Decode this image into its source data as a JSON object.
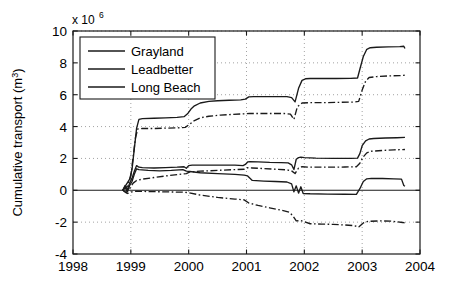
{
  "chart_data": {
    "type": "line",
    "title": "",
    "subtitle": "",
    "xlabel": "",
    "ylabel": "Cumulative transport (m",
    "ylabel_sup": "3",
    "ylabel_tail": ")",
    "y_multiplier_text": "x 10",
    "y_multiplier_exp": "6",
    "y_multiplier_value": 1000000,
    "xlim": [
      1998,
      2004
    ],
    "ylim": [
      -4,
      10
    ],
    "xticks": [
      1998,
      1999,
      2000,
      2001,
      2002,
      2003,
      2004
    ],
    "xticklabels": [
      "1998",
      "1999",
      "2000",
      "2001",
      "2002",
      "2003",
      "2004"
    ],
    "yticks": [
      -4,
      -2,
      0,
      2,
      4,
      6,
      8,
      10
    ],
    "yticklabels": [
      "-4",
      "-2",
      "0",
      "2",
      "4",
      "6",
      "8",
      "10"
    ],
    "grid": true,
    "grid_style": "dotted",
    "legend_position": "upper-left",
    "legend_entries": [
      "Grayland",
      "Leadbetter",
      "Long Beach"
    ],
    "line_color": "#1a1a1a",
    "series": [
      {
        "name": "Grayland",
        "style": "solid",
        "points": [
          [
            1998.86,
            0.0
          ],
          [
            1998.9,
            0.3
          ],
          [
            1998.94,
            0.05
          ],
          [
            1998.98,
            0.45
          ],
          [
            1999.02,
            0.75
          ],
          [
            1999.06,
            1.2
          ],
          [
            1999.1,
            1.55
          ],
          [
            1999.14,
            1.45
          ],
          [
            1999.2,
            1.42
          ],
          [
            1999.4,
            1.4
          ],
          [
            1999.6,
            1.42
          ],
          [
            1999.8,
            1.45
          ],
          [
            1999.92,
            1.48
          ],
          [
            1999.96,
            1.38
          ],
          [
            2000.0,
            1.55
          ],
          [
            2000.06,
            1.58
          ],
          [
            2000.2,
            1.58
          ],
          [
            2000.5,
            1.58
          ],
          [
            2000.8,
            1.58
          ],
          [
            2000.94,
            1.55
          ],
          [
            2000.98,
            1.62
          ],
          [
            2001.02,
            1.78
          ],
          [
            2001.06,
            1.8
          ],
          [
            2001.2,
            1.78
          ],
          [
            2001.4,
            1.75
          ],
          [
            2001.6,
            1.74
          ],
          [
            2001.72,
            1.72
          ],
          [
            2001.78,
            1.6
          ],
          [
            2001.82,
            1.3
          ],
          [
            2001.86,
            1.95
          ],
          [
            2001.9,
            2.05
          ],
          [
            2001.94,
            2.08
          ],
          [
            2002.0,
            2.05
          ],
          [
            2002.2,
            2.02
          ],
          [
            2002.5,
            2.0
          ],
          [
            2002.8,
            2.0
          ],
          [
            2002.92,
            2.02
          ],
          [
            2002.96,
            2.3
          ],
          [
            2003.0,
            2.8
          ],
          [
            2003.06,
            3.1
          ],
          [
            2003.12,
            3.22
          ],
          [
            2003.2,
            3.25
          ],
          [
            2003.4,
            3.28
          ],
          [
            2003.6,
            3.3
          ],
          [
            2003.74,
            3.32
          ]
        ]
      },
      {
        "name": "Grayland-alt",
        "style": "dashdot",
        "points": [
          [
            1998.86,
            0.0
          ],
          [
            1998.92,
            -0.15
          ],
          [
            1998.98,
            0.1
          ],
          [
            1999.04,
            0.45
          ],
          [
            1999.1,
            0.62
          ],
          [
            1999.2,
            0.7
          ],
          [
            1999.4,
            0.8
          ],
          [
            1999.6,
            0.9
          ],
          [
            1999.8,
            0.98
          ],
          [
            1999.96,
            1.05
          ],
          [
            2000.02,
            1.15
          ],
          [
            2000.2,
            1.2
          ],
          [
            2000.5,
            1.25
          ],
          [
            2000.8,
            1.3
          ],
          [
            2000.96,
            1.32
          ],
          [
            2001.02,
            1.42
          ],
          [
            2001.1,
            1.4
          ],
          [
            2001.3,
            1.36
          ],
          [
            2001.5,
            1.32
          ],
          [
            2001.7,
            1.28
          ],
          [
            2001.78,
            1.22
          ],
          [
            2001.84,
            1.05
          ],
          [
            2001.9,
            1.4
          ],
          [
            2001.96,
            1.48
          ],
          [
            2002.1,
            1.45
          ],
          [
            2002.4,
            1.45
          ],
          [
            2002.7,
            1.46
          ],
          [
            2002.9,
            1.48
          ],
          [
            2002.96,
            1.7
          ],
          [
            2003.02,
            2.1
          ],
          [
            2003.08,
            2.35
          ],
          [
            2003.16,
            2.45
          ],
          [
            2003.35,
            2.5
          ],
          [
            2003.55,
            2.54
          ],
          [
            2003.74,
            2.56
          ]
        ]
      },
      {
        "name": "Leadbetter",
        "style": "solid",
        "points": [
          [
            1998.86,
            0.0
          ],
          [
            1998.9,
            0.2
          ],
          [
            1998.94,
            -0.1
          ],
          [
            1998.98,
            0.3
          ],
          [
            1999.02,
            0.55
          ],
          [
            1999.06,
            1.0
          ],
          [
            1999.1,
            1.35
          ],
          [
            1999.14,
            1.3
          ],
          [
            1999.3,
            1.25
          ],
          [
            1999.5,
            1.22
          ],
          [
            1999.7,
            1.25
          ],
          [
            1999.9,
            1.3
          ],
          [
            1999.96,
            1.2
          ],
          [
            2000.02,
            1.18
          ],
          [
            2000.2,
            1.1
          ],
          [
            2000.5,
            1.05
          ],
          [
            2000.8,
            1.0
          ],
          [
            2000.96,
            0.95
          ],
          [
            2001.02,
            0.9
          ],
          [
            2001.1,
            0.62
          ],
          [
            2001.3,
            0.58
          ],
          [
            2001.5,
            0.55
          ],
          [
            2001.7,
            0.52
          ],
          [
            2001.78,
            0.4
          ],
          [
            2001.82,
            -0.1
          ],
          [
            2001.86,
            0.28
          ],
          [
            2001.9,
            -0.18
          ],
          [
            2001.94,
            0.22
          ],
          [
            2001.98,
            -0.2
          ],
          [
            2002.1,
            -0.22
          ],
          [
            2002.4,
            -0.24
          ],
          [
            2002.7,
            -0.25
          ],
          [
            2002.9,
            -0.26
          ],
          [
            2002.96,
            0.1
          ],
          [
            2003.02,
            0.55
          ],
          [
            2003.08,
            0.72
          ],
          [
            2003.16,
            0.75
          ],
          [
            2003.35,
            0.74
          ],
          [
            2003.55,
            0.72
          ],
          [
            2003.68,
            0.7
          ],
          [
            2003.72,
            0.3
          ],
          [
            2003.74,
            0.25
          ]
        ]
      },
      {
        "name": "Leadbetter-alt",
        "style": "dashdot",
        "points": [
          [
            1998.86,
            0.0
          ],
          [
            1998.94,
            -0.2
          ],
          [
            1999.02,
            -0.1
          ],
          [
            1999.1,
            -0.05
          ],
          [
            1999.3,
            -0.08
          ],
          [
            1999.6,
            -0.1
          ],
          [
            1999.9,
            -0.12
          ],
          [
            2000.0,
            -0.15
          ],
          [
            2000.2,
            -0.3
          ],
          [
            2000.5,
            -0.45
          ],
          [
            2000.8,
            -0.55
          ],
          [
            2000.96,
            -0.6
          ],
          [
            2001.04,
            -0.8
          ],
          [
            2001.2,
            -0.95
          ],
          [
            2001.4,
            -1.1
          ],
          [
            2001.6,
            -1.25
          ],
          [
            2001.74,
            -1.38
          ],
          [
            2001.8,
            -1.6
          ],
          [
            2001.86,
            -1.92
          ],
          [
            2001.94,
            -1.9
          ],
          [
            2002.1,
            -2.1
          ],
          [
            2002.3,
            -2.12
          ],
          [
            2002.5,
            -2.14
          ],
          [
            2002.7,
            -2.18
          ],
          [
            2002.86,
            -2.22
          ],
          [
            2002.94,
            -2.3
          ],
          [
            2003.02,
            -2.05
          ],
          [
            2003.1,
            -1.95
          ],
          [
            2003.3,
            -1.92
          ],
          [
            2003.5,
            -1.94
          ],
          [
            2003.7,
            -2.02
          ],
          [
            2003.74,
            -2.05
          ]
        ]
      },
      {
        "name": "Long Beach",
        "style": "solid",
        "points": [
          [
            1998.86,
            0.0
          ],
          [
            1998.92,
            0.35
          ],
          [
            1998.98,
            0.7
          ],
          [
            1999.02,
            1.3
          ],
          [
            1999.06,
            2.6
          ],
          [
            1999.1,
            3.9
          ],
          [
            1999.14,
            4.45
          ],
          [
            1999.2,
            4.5
          ],
          [
            1999.4,
            4.52
          ],
          [
            1999.6,
            4.55
          ],
          [
            1999.8,
            4.58
          ],
          [
            1999.92,
            4.62
          ],
          [
            1999.98,
            4.8
          ],
          [
            2000.04,
            5.1
          ],
          [
            2000.1,
            5.3
          ],
          [
            2000.2,
            5.48
          ],
          [
            2000.35,
            5.58
          ],
          [
            2000.5,
            5.62
          ],
          [
            2000.7,
            5.65
          ],
          [
            2000.9,
            5.68
          ],
          [
            2000.98,
            5.72
          ],
          [
            2001.04,
            5.86
          ],
          [
            2001.12,
            5.88
          ],
          [
            2001.3,
            5.88
          ],
          [
            2001.5,
            5.88
          ],
          [
            2001.7,
            5.88
          ],
          [
            2001.78,
            5.82
          ],
          [
            2001.84,
            5.55
          ],
          [
            2001.9,
            6.4
          ],
          [
            2001.96,
            6.9
          ],
          [
            2002.02,
            7.0
          ],
          [
            2002.1,
            7.02
          ],
          [
            2002.3,
            7.02
          ],
          [
            2002.55,
            7.02
          ],
          [
            2002.8,
            7.03
          ],
          [
            2002.92,
            7.05
          ],
          [
            2002.96,
            7.6
          ],
          [
            2003.02,
            8.4
          ],
          [
            2003.08,
            8.85
          ],
          [
            2003.14,
            8.95
          ],
          [
            2003.25,
            8.98
          ],
          [
            2003.45,
            9.0
          ],
          [
            2003.65,
            9.02
          ],
          [
            2003.72,
            9.04
          ],
          [
            2003.74,
            8.9
          ]
        ]
      },
      {
        "name": "Long Beach-alt",
        "style": "dashdot",
        "points": [
          [
            1998.86,
            0.0
          ],
          [
            1998.94,
            0.25
          ],
          [
            1999.0,
            0.9
          ],
          [
            1999.04,
            2.1
          ],
          [
            1999.08,
            3.3
          ],
          [
            1999.12,
            3.85
          ],
          [
            1999.2,
            3.88
          ],
          [
            1999.4,
            3.88
          ],
          [
            1999.6,
            3.9
          ],
          [
            1999.8,
            3.92
          ],
          [
            1999.94,
            3.95
          ],
          [
            2000.02,
            4.15
          ],
          [
            2000.1,
            4.38
          ],
          [
            2000.2,
            4.55
          ],
          [
            2000.35,
            4.65
          ],
          [
            2000.55,
            4.72
          ],
          [
            2000.75,
            4.76
          ],
          [
            2000.95,
            4.8
          ],
          [
            2001.05,
            4.82
          ],
          [
            2001.25,
            4.82
          ],
          [
            2001.45,
            4.82
          ],
          [
            2001.65,
            4.82
          ],
          [
            2001.76,
            4.78
          ],
          [
            2001.82,
            4.45
          ],
          [
            2001.88,
            5.25
          ],
          [
            2001.96,
            5.48
          ],
          [
            2002.1,
            5.5
          ],
          [
            2002.35,
            5.5
          ],
          [
            2002.6,
            5.52
          ],
          [
            2002.85,
            5.54
          ],
          [
            2002.94,
            5.58
          ],
          [
            2003.0,
            6.3
          ],
          [
            2003.06,
            6.85
          ],
          [
            2003.12,
            7.08
          ],
          [
            2003.25,
            7.14
          ],
          [
            2003.45,
            7.18
          ],
          [
            2003.65,
            7.2
          ],
          [
            2003.74,
            7.22
          ]
        ]
      }
    ]
  }
}
